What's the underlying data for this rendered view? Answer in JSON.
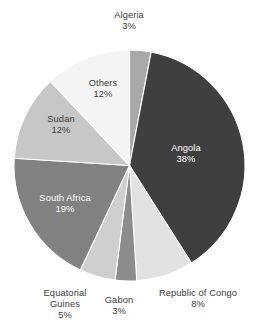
{
  "chart_data": {
    "type": "pie",
    "title": "",
    "subtitle": "",
    "xlabel": "",
    "ylabel": "",
    "legend_position": "none",
    "grid": false,
    "labels_on_slices": true,
    "start_angle_deg": 0,
    "direction": "clockwise",
    "categories": [
      "Algeria",
      "Angola",
      "Republic of Congo",
      "Gabon",
      "Equatorial Guines",
      "South Africa",
      "Sudan",
      "Others"
    ],
    "values": [
      3,
      38,
      8,
      3,
      5,
      19,
      12,
      12
    ],
    "value_unit": "%",
    "colors": [
      "#a9a9a9",
      "#3f3f3f",
      "#e2e2e2",
      "#8c8c8c",
      "#cfcfcf",
      "#818181",
      "#c7c7c7",
      "#f4f4f4"
    ],
    "slices": [
      {
        "name": "Algeria",
        "value": 3,
        "percent_text": "3%",
        "color": "#a9a9a9",
        "label_color": "#3a3a3a",
        "label_placement": "outside-top"
      },
      {
        "name": "Angola",
        "value": 38,
        "percent_text": "38%",
        "color": "#3f3f3f",
        "label_color": "#ffffff",
        "label_placement": "inside"
      },
      {
        "name": "Republic of Congo",
        "value": 8,
        "percent_text": "8%",
        "color": "#e2e2e2",
        "label_color": "#3a3a3a",
        "label_placement": "outside-bottom"
      },
      {
        "name": "Gabon",
        "value": 3,
        "percent_text": "3%",
        "color": "#8c8c8c",
        "label_color": "#3a3a3a",
        "label_placement": "outside-bottom"
      },
      {
        "name": "Equatorial Guines",
        "value": 5,
        "percent_text": "5%",
        "color": "#cfcfcf",
        "label_color": "#3a3a3a",
        "label_placement": "outside-bottom"
      },
      {
        "name": "South Africa",
        "value": 19,
        "percent_text": "19%",
        "color": "#818181",
        "label_color": "#ffffff",
        "label_placement": "inside"
      },
      {
        "name": "Sudan",
        "value": 12,
        "percent_text": "12%",
        "color": "#c7c7c7",
        "label_color": "#3a3a3a",
        "label_placement": "inside"
      },
      {
        "name": "Others",
        "value": 12,
        "percent_text": "12%",
        "color": "#f4f4f4",
        "label_color": "#3a3a3a",
        "label_placement": "inside"
      }
    ]
  },
  "labels": {
    "algeria": {
      "name": "Algeria",
      "value": "3%"
    },
    "angola": {
      "name": "Angola",
      "value": "38%"
    },
    "republic_of_congo": {
      "name": "Republic of Congo",
      "value": "8%"
    },
    "gabon": {
      "name": "Gabon",
      "value": "3%"
    },
    "equatorial_line1": {
      "name": "Equatorial",
      "name2": "Guines",
      "value": "5%"
    },
    "south_africa": {
      "name": "South Africa",
      "value": "19%"
    },
    "sudan": {
      "name": "Sudan",
      "value": "12%"
    },
    "others": {
      "name": "Others",
      "value": "12%"
    }
  },
  "canvas": {
    "background": "#ffffff",
    "width": 259,
    "height": 332
  }
}
